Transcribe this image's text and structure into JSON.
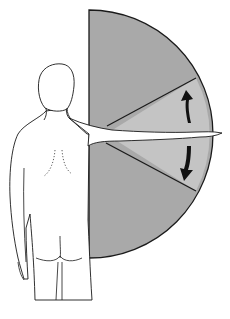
{
  "figure": {
    "colors": {
      "outer_sector": "#a9a9a9",
      "inner_wedge": "#c4c4c4",
      "outline": "#1a1a1a",
      "arrows": "#111111",
      "background": "#ffffff"
    },
    "arrows": [
      {
        "direction": "up",
        "label": ""
      },
      {
        "direction": "down",
        "label": ""
      }
    ]
  },
  "caption": {
    "text": ""
  }
}
